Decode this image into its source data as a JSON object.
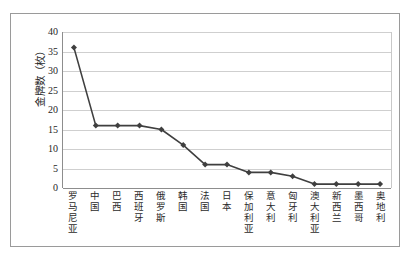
{
  "chart_data": {
    "type": "line",
    "title": "",
    "xlabel": "",
    "ylabel": "金牌数（枚）",
    "ylim": [
      0,
      40
    ],
    "yticks": [
      40,
      35,
      30,
      25,
      20,
      15,
      10,
      5,
      0
    ],
    "grid": true,
    "legend": "none",
    "marker": "diamond",
    "series_color": "#3f3f3f",
    "grid_color": "#cfcfcf",
    "axis_color": "#8d8d8d",
    "frame_color": "#9a9a9a",
    "categories": [
      "罗马尼亚",
      "中国",
      "巴西",
      "西班牙",
      "俄罗斯",
      "韩国",
      "法国",
      "日本",
      "保加利亚",
      "意大利",
      "匈牙利",
      "澳大利亚",
      "新西兰",
      "墨西哥",
      "奥地利"
    ],
    "values": [
      36,
      16,
      16,
      16,
      15,
      11,
      6,
      6,
      4,
      4,
      3,
      1,
      1,
      1,
      1
    ]
  }
}
